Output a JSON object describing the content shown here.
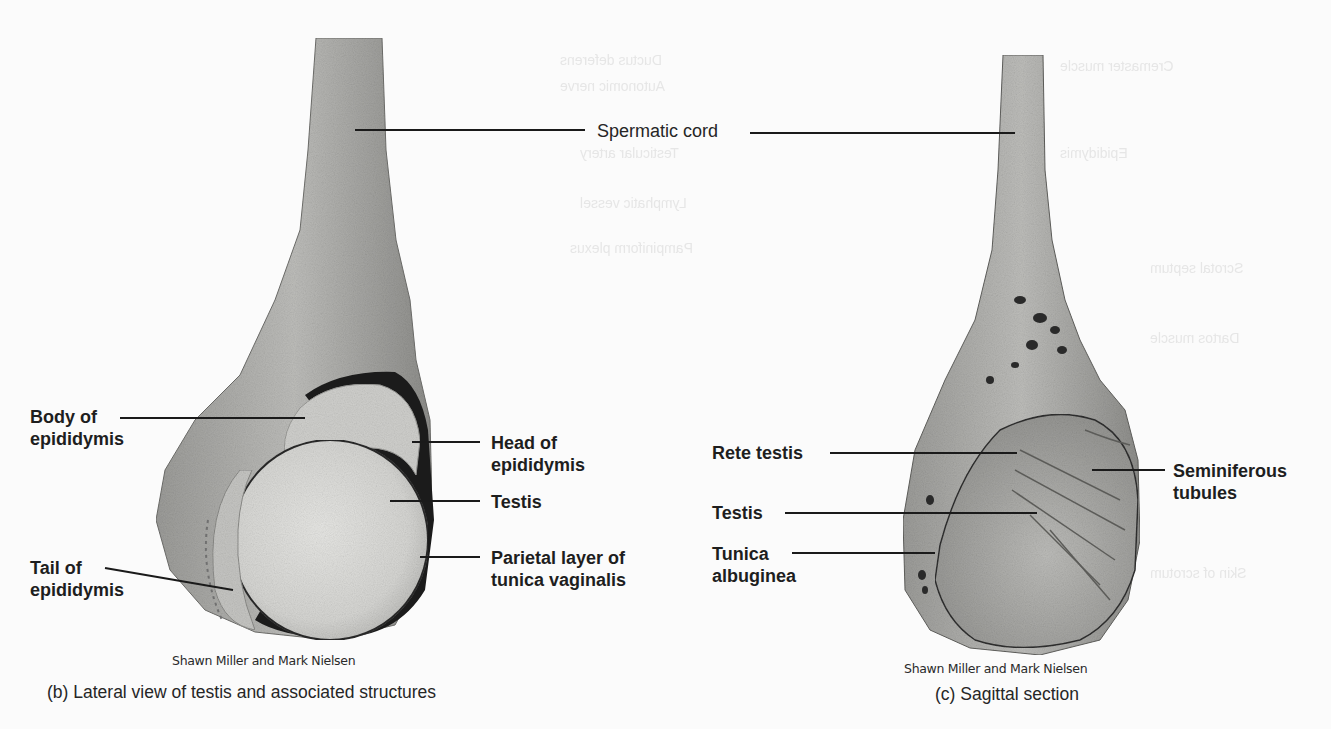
{
  "figure": {
    "panels": [
      {
        "id": "b",
        "caption": "(b) Lateral view of testis and associated structures",
        "credit": "Shawn Miller and Mark Nielsen",
        "labels": {
          "body_of_epididymis": "Body of\nepididymis",
          "tail_of_epididymis": "Tail of\nepididymis",
          "head_of_epididymis": "Head of\nepididymis",
          "testis": "Testis",
          "parietal_layer": "Parietal layer of\ntunica vaginalis"
        }
      },
      {
        "id": "c",
        "caption": "(c) Sagittal section",
        "credit": "Shawn Miller and Mark Nielsen",
        "labels": {
          "rete_testis": "Rete testis",
          "testis": "Testis",
          "tunica_albuginea": "Tunica\nalbuginea",
          "seminiferous_tubules": "Seminiferous\ntubules"
        }
      }
    ],
    "shared_labels": {
      "spermatic_cord": "Spermatic cord"
    },
    "colors": {
      "background": "#fbfbfb",
      "leader_line": "#1a1a1a",
      "specimen_light": "#d8d8d6",
      "specimen_mid": "#a9a9a6",
      "specimen_dark": "#1b1b1b"
    }
  }
}
